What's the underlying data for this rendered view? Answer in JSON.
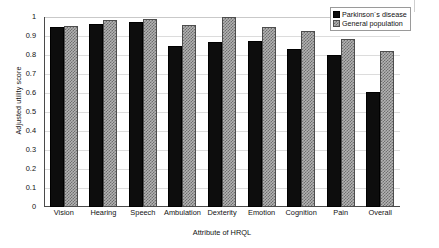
{
  "chart_data": {
    "type": "bar",
    "title": "",
    "xlabel": "Attribute of HRQL",
    "ylabel": "Adjusted utility score",
    "ylim": [
      0,
      1
    ],
    "ytick_labels": [
      "1",
      "0.9",
      "0.8",
      "0.7",
      "0.6",
      "0.5",
      "0.4",
      "0.3",
      "0.2",
      "0.1",
      "0"
    ],
    "ytick_values": [
      1,
      0.9,
      0.8,
      0.7,
      0.6,
      0.5,
      0.4,
      0.3,
      0.2,
      0.1,
      0
    ],
    "grid": true,
    "legend_position": "top-right",
    "categories": [
      "Vision",
      "Hearing",
      "Speech",
      "Ambulation",
      "Dexterity",
      "Emotion",
      "Cognition",
      "Pain",
      "Overall"
    ],
    "series": [
      {
        "name": "Parkinson´s disease",
        "color": "#0d0d0d",
        "pattern": "solid",
        "values": [
          0.945,
          0.965,
          0.975,
          0.85,
          0.87,
          0.875,
          0.83,
          0.8,
          0.605
        ]
      },
      {
        "name": "General population",
        "color": "#b3b3b3",
        "pattern": "checkered",
        "values": [
          0.955,
          0.985,
          0.99,
          0.96,
          1.0,
          0.945,
          0.925,
          0.885,
          0.82
        ]
      }
    ]
  },
  "legend": {
    "items": [
      {
        "label": "Parkinson´s disease"
      },
      {
        "label": "General population"
      }
    ]
  }
}
